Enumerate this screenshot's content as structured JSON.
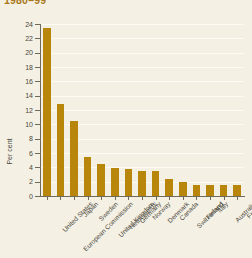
{
  "chart_data": {
    "type": "bar",
    "title": "1980–99",
    "xlabel": "",
    "ylabel": "Per cent",
    "ylim": [
      0,
      24
    ],
    "ytick_step": 2,
    "yticks": [
      0,
      2,
      4,
      6,
      8,
      10,
      12,
      14,
      16,
      18,
      20,
      22,
      24
    ],
    "grid": true,
    "legend": null,
    "categories": [
      "United States",
      "European Commission",
      "Japan",
      "Sweden",
      "United Kingdom",
      "Netherlands",
      "Germany",
      "Norway",
      "Denmark",
      "Canada",
      "Switzerland",
      "Finland",
      "Italy",
      "Australia",
      "France"
    ],
    "values": [
      23.5,
      12.8,
      10.5,
      5.5,
      4.5,
      3.9,
      3.7,
      3.5,
      3.5,
      2.4,
      1.9,
      1.6,
      1.6,
      1.6,
      1.6
    ],
    "bar_color": "#B8860B",
    "background_color": "#F4F1E4",
    "gridline_color": "#FCFBF4",
    "axis_color": "#6E6A5A",
    "title_color": "#A8781A",
    "text_color": "#4A463C"
  }
}
